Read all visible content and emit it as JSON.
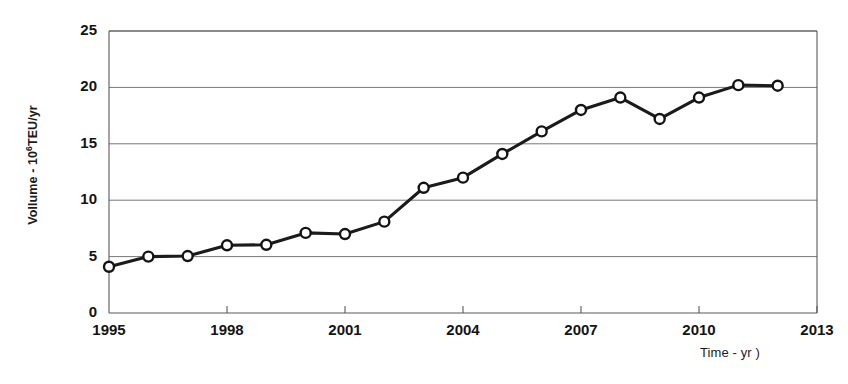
{
  "chart_data": {
    "type": "line",
    "title": "",
    "subtitle": "",
    "xlabel": "Time - yr )",
    "ylabel": "Vollume - 10⁶TEU/yr",
    "ylabel_parts": {
      "prefix": "Vollume - 10",
      "exponent": "6",
      "suffix": "TEU/yr"
    },
    "x": [
      1995,
      1996,
      1997,
      1998,
      1999,
      2000,
      2001,
      2002,
      2003,
      2004,
      2005,
      2006,
      2007,
      2008,
      2009,
      2010,
      2011,
      2012
    ],
    "values": [
      4.1,
      5.0,
      5.05,
      6.0,
      6.05,
      7.1,
      7.0,
      8.1,
      11.1,
      12.0,
      14.1,
      16.1,
      18.0,
      19.1,
      17.2,
      19.1,
      20.2,
      20.15
    ],
    "series": [
      {
        "name": "Container volume",
        "values": [
          4.1,
          5.0,
          5.05,
          6.0,
          6.05,
          7.1,
          7.0,
          8.1,
          11.1,
          12.0,
          14.1,
          16.1,
          18.0,
          19.1,
          17.2,
          19.1,
          20.2,
          20.15
        ]
      }
    ],
    "xlim": [
      1995,
      2013
    ],
    "ylim": [
      0,
      25
    ],
    "yticks": [
      0,
      5,
      10,
      15,
      20,
      25
    ],
    "ytick_labels": [
      "0",
      "5",
      "10",
      "15",
      "20",
      "25"
    ],
    "xticks": [
      1995,
      1998,
      2001,
      2004,
      2007,
      2010,
      2013
    ],
    "xtick_labels": [
      "1995",
      "1998",
      "2001",
      "2004",
      "2007",
      "2010",
      "2013"
    ],
    "xtick_minor_interval": 1,
    "grid": "horizontal",
    "legend": "none",
    "marker": "open-circle",
    "line_color": "#1b1b1b",
    "marker_fill": "#ffffff",
    "grid_color": "#777777",
    "background": "#ffffff"
  }
}
